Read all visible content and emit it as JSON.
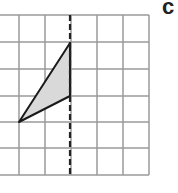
{
  "label": "c",
  "grid": {
    "x_lines": [
      -7,
      19,
      45,
      71,
      97,
      123,
      149
    ],
    "y_lines": [
      15,
      42,
      69,
      96,
      122,
      148,
      175
    ],
    "line_color": "#9a9a9a"
  },
  "mirror_line": {
    "x": 70,
    "y1": 15,
    "y2": 175,
    "style": "dashed",
    "color": "#222222"
  },
  "triangle": {
    "points": [
      [
        70,
        43
      ],
      [
        70,
        96
      ],
      [
        19,
        122
      ]
    ],
    "fill": "#d9d9d9",
    "stroke": "#1a1a1a"
  }
}
